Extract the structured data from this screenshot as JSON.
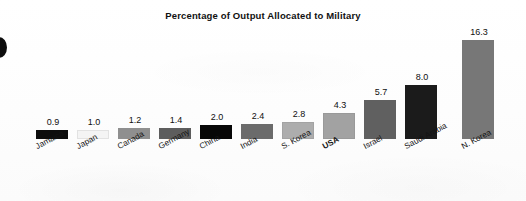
{
  "chart_data": {
    "type": "bar",
    "title": "Percentage of Output Allocated to Military",
    "xlabel": "",
    "ylabel": "",
    "grid": false,
    "legend": "none",
    "axis_visible": false,
    "categories": [
      "Jamaica",
      "Japan",
      "Canada",
      "Germany",
      "China",
      "India",
      "S. Korea",
      "USA",
      "Israel",
      "Saudi Arabia",
      "N. Korea"
    ],
    "values": [
      0.9,
      1.0,
      1.2,
      1.4,
      2.0,
      2.4,
      2.8,
      4.3,
      5.7,
      8.0,
      16.3
    ],
    "value_labels": [
      "0.9",
      "1.0",
      "1.2",
      "1.4",
      "2.0",
      "2.4",
      "2.8",
      "4.3",
      "5.7",
      "8.0",
      "16.3"
    ],
    "bar_colors": [
      "#0d0d0d",
      "#f2f2f2",
      "#8f8f8f",
      "#5d5d5d",
      "#070707",
      "#6b6b6b",
      "#adadad",
      "#a2a2a2",
      "#606060",
      "#1b1b1b",
      "#777777"
    ],
    "highlighted_category": "USA",
    "ylim": [
      0,
      17.5
    ]
  },
  "bars": [
    {
      "label": "Jamaica",
      "value_label": "0.9",
      "color": "#0d0d0d",
      "border": "#0d0d0d",
      "x": 36,
      "top": 130,
      "bold": false
    },
    {
      "label": "Japan",
      "value_label": "1.0",
      "color": "#f4f4f4",
      "border": "#e2e2e2",
      "x": 77,
      "top": 130,
      "bold": false
    },
    {
      "label": "Canada",
      "value_label": "1.2",
      "color": "#8f8f8f",
      "border": "#8f8f8f",
      "x": 118,
      "top": 128,
      "bold": false
    },
    {
      "label": "Germany",
      "value_label": "1.4",
      "color": "#5d5d5d",
      "border": "#5d5d5d",
      "x": 159,
      "top": 128,
      "bold": false
    },
    {
      "label": "China",
      "value_label": "2.0",
      "color": "#070707",
      "border": "#070707",
      "x": 200,
      "top": 125,
      "bold": false
    },
    {
      "label": "India",
      "value_label": "2.4",
      "color": "#6b6b6b",
      "border": "#6b6b6b",
      "x": 241,
      "top": 124,
      "bold": false
    },
    {
      "label": "S. Korea",
      "value_label": "2.8",
      "color": "#adadad",
      "border": "#a3a3a3",
      "x": 282,
      "top": 122,
      "bold": false
    },
    {
      "label": "USA",
      "value_label": "4.3",
      "color": "#a2a2a2",
      "border": "#999999",
      "x": 323,
      "top": 113,
      "bold": true
    },
    {
      "label": "Israel",
      "value_label": "5.7",
      "color": "#606060",
      "border": "#606060",
      "x": 364,
      "top": 100,
      "bold": false
    },
    {
      "label": "Saudi Arabia",
      "value_label": "8.0",
      "color": "#1b1b1b",
      "border": "#1b1b1b",
      "x": 405,
      "top": 85,
      "bold": false
    },
    {
      "label": "N. Korea",
      "value_label": "16.3",
      "color": "#777777",
      "border": "#777777",
      "x": 462,
      "top": 40,
      "bold": false
    }
  ],
  "baseline_y": 139,
  "decorations": {
    "left_bullet_icon": "filled-circle-bullet"
  }
}
